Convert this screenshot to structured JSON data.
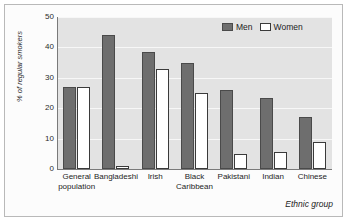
{
  "chart_data": {
    "type": "bar",
    "title": "",
    "xlabel": "Ethnic group",
    "ylabel": "% of regular smokers",
    "ylim": [
      0,
      50
    ],
    "yticks": [
      0,
      10,
      20,
      30,
      40,
      50
    ],
    "grid": true,
    "legend_position": "top-right",
    "categories": [
      "General population",
      "Bangladeshi",
      "Irish",
      "Black Caribbean",
      "Pakistani",
      "Indian",
      "Chinese"
    ],
    "category_lines": [
      [
        "General",
        "population"
      ],
      [
        "Bangladeshi"
      ],
      [
        "Irish"
      ],
      [
        "Black",
        "Caribbean"
      ],
      [
        "Pakistani"
      ],
      [
        "Indian"
      ],
      [
        "Chinese"
      ]
    ],
    "series": [
      {
        "name": "Men",
        "color": "#6e6e6e",
        "values": [
          27,
          44,
          38.5,
          35,
          26,
          23.5,
          17
        ]
      },
      {
        "name": "Women",
        "color": "#ffffff",
        "values": [
          27,
          1,
          33,
          25,
          5,
          5.5,
          9
        ]
      }
    ]
  },
  "legend": {
    "men_label": "Men",
    "women_label": "Women"
  },
  "axes": {
    "y_label": "% of regular smokers",
    "x_label": "Ethnic group",
    "y_tick_0": "0",
    "y_tick_1": "10",
    "y_tick_2": "20",
    "y_tick_3": "30",
    "y_tick_4": "40",
    "y_tick_5": "50"
  },
  "colors": {
    "plot_background": "#e3e3e3",
    "men_bar": "#6e6e6e",
    "women_bar": "#ffffff",
    "gridline": "#f7f7f7",
    "frame": "#b9b9b9"
  }
}
